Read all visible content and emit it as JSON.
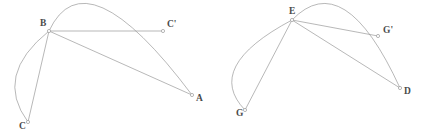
{
  "figure": {
    "background_color": "#ffffff",
    "stroke_color": "#9a9a9a",
    "label_color": "#4a4a4a",
    "stroke_width": 0.7,
    "marker_radius": 1.6,
    "diagrams": [
      {
        "name": "left-diagram",
        "points": [
          {
            "label": "B",
            "x": 49,
            "y": 31
          },
          {
            "label": "C'",
            "x": 163,
            "y": 31
          },
          {
            "label": "A",
            "x": 192,
            "y": 95
          },
          {
            "label": "C",
            "x": 28,
            "y": 122
          }
        ],
        "label_offsets": [
          {
            "label": "B",
            "dx": -9,
            "dy": -5
          },
          {
            "label": "C'",
            "dx": 4,
            "dy": -4
          },
          {
            "label": "A",
            "dx": 4,
            "dy": 6
          },
          {
            "label": "C",
            "dx": -9,
            "dy": 7
          }
        ],
        "segments": [
          {
            "name": "chord-b-cprime",
            "from": "B",
            "to": "C'"
          },
          {
            "name": "chord-b-a",
            "from": "B",
            "to": "A"
          },
          {
            "name": "chord-b-c",
            "from": "B",
            "to": "C"
          }
        ],
        "arcs": [
          {
            "name": "major-arc-b-a",
            "from": "B",
            "to": "A",
            "apex_x": 103,
            "apex_y": 8
          },
          {
            "name": "minor-arc-b-c",
            "from": "B",
            "to": "C",
            "apex_x": 16,
            "apex_y": 76
          }
        ]
      },
      {
        "name": "right-diagram",
        "points": [
          {
            "label": "E",
            "x": 292,
            "y": 20
          },
          {
            "label": "G'",
            "x": 378,
            "y": 36
          },
          {
            "label": "D",
            "x": 400,
            "y": 88
          },
          {
            "label": "G",
            "x": 245,
            "y": 110
          }
        ],
        "label_offsets": [
          {
            "label": "E",
            "dx": -3,
            "dy": -6
          },
          {
            "label": "G'",
            "dx": 5,
            "dy": -3
          },
          {
            "label": "D",
            "dx": 4,
            "dy": 6
          },
          {
            "label": "G",
            "dx": -9,
            "dy": 6
          }
        ],
        "segments": [
          {
            "name": "chord-e-gprime",
            "from": "E",
            "to": "G'"
          },
          {
            "name": "chord-e-d",
            "from": "E",
            "to": "D"
          },
          {
            "name": "chord-e-g",
            "from": "E",
            "to": "G"
          }
        ],
        "arcs": [
          {
            "name": "major-arc-e-d",
            "from": "E",
            "to": "D",
            "apex_x": 345,
            "apex_y": 10
          },
          {
            "name": "minor-arc-e-g",
            "from": "E",
            "to": "G",
            "apex_x": 236,
            "apex_y": 66
          }
        ]
      }
    ]
  }
}
